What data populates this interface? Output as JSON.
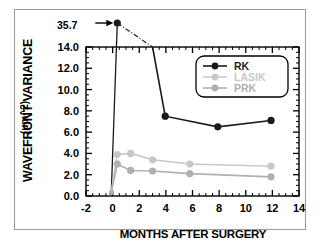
{
  "figure": {
    "annotation": "35.7",
    "border_color": "#9a9a9a"
  },
  "chart_data": {
    "type": "line",
    "title": "",
    "xlabel": "MONTHS AFTER SURGERY",
    "ylabel": "WAVEFRONT VARIANCE",
    "ylabel_units": "(μm^2)",
    "xlim": [
      -2,
      14
    ],
    "ylim": [
      0.0,
      14.0
    ],
    "xticks": [
      -2,
      0,
      2,
      4,
      6,
      8,
      10,
      12,
      14
    ],
    "xtick_labels": [
      "-2",
      "0",
      "2",
      "4",
      "6",
      "8",
      "10",
      "12",
      "14"
    ],
    "yticks": [
      0.0,
      2.0,
      4.0,
      6.0,
      8.0,
      10.0,
      12.0,
      14.0
    ],
    "ytick_labels": [
      "0.0",
      "2.0",
      "4.0",
      "6.0",
      "8.0",
      "10.0",
      "12.0",
      "14.0"
    ],
    "grid": false,
    "minor_ticks": true,
    "legend_position": "upper-right",
    "annotations": [
      {
        "text": "35.7",
        "points_to_x": 0.35,
        "points_to_y": 35.7,
        "arrow": "right"
      }
    ],
    "series": [
      {
        "name": "RK",
        "color": "#1a1a1a",
        "x": [
          -0.1,
          0.35,
          3.0,
          3.95,
          7.9,
          11.9
        ],
        "values": [
          0.3,
          35.7,
          14.0,
          7.5,
          6.5,
          7.1
        ],
        "offscale_point": {
          "x": 0.35,
          "y": 35.7
        }
      },
      {
        "name": "LASIK",
        "color": "#c8c8c8",
        "x": [
          -0.1,
          0.35,
          1.35,
          3.0,
          5.8,
          11.9
        ],
        "values": [
          0.4,
          3.9,
          4.0,
          3.4,
          3.0,
          2.8
        ]
      },
      {
        "name": "PRK",
        "color": "#b0b0b0",
        "x": [
          -0.1,
          0.35,
          1.35,
          3.0,
          5.8,
          11.9
        ],
        "values": [
          0.3,
          3.0,
          2.4,
          2.35,
          2.1,
          1.8
        ]
      }
    ]
  },
  "legend": {
    "items": [
      {
        "label": "RK",
        "color": "#1a1a1a"
      },
      {
        "label": "LASIK",
        "color": "#c8c8c8"
      },
      {
        "label": "PRK",
        "color": "#b0b0b0"
      }
    ]
  }
}
